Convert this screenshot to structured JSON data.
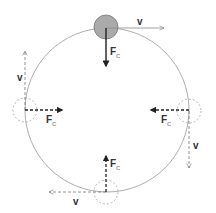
{
  "diagram": {
    "path": {
      "cx": 107,
      "cy": 110,
      "r": 82,
      "color": "#999999"
    },
    "colors": {
      "solid_arrow": "#888888",
      "force_arrow": "#222222",
      "dashed_arrow": "#777777",
      "ball_fill": "#aaaaaa",
      "ball_outline": "#777777",
      "ghost_outline": "#999999"
    },
    "positions": [
      {
        "name": "top",
        "style": "solid",
        "ball": {
          "cx": 106,
          "cy": 27,
          "r": 12
        },
        "velocity": {
          "label": "v",
          "direction": "right"
        },
        "force": {
          "label": "F",
          "subscript": "C",
          "direction": "down"
        }
      },
      {
        "name": "left",
        "style": "dashed",
        "ball": {
          "cx": 25,
          "cy": 110,
          "r": 12
        },
        "velocity": {
          "label": "v",
          "direction": "up"
        },
        "force": {
          "label": "F",
          "subscript": "C",
          "direction": "right"
        }
      },
      {
        "name": "right",
        "style": "dashed",
        "ball": {
          "cx": 189,
          "cy": 111,
          "r": 12
        },
        "velocity": {
          "label": "v",
          "direction": "down"
        },
        "force": {
          "label": "F",
          "subscript": "C",
          "direction": "left"
        }
      },
      {
        "name": "bottom",
        "style": "dashed",
        "ball": {
          "cx": 106,
          "cy": 192,
          "r": 12
        },
        "velocity": {
          "label": "v",
          "direction": "left"
        },
        "force": {
          "label": "F",
          "subscript": "C",
          "direction": "up"
        }
      }
    ]
  }
}
